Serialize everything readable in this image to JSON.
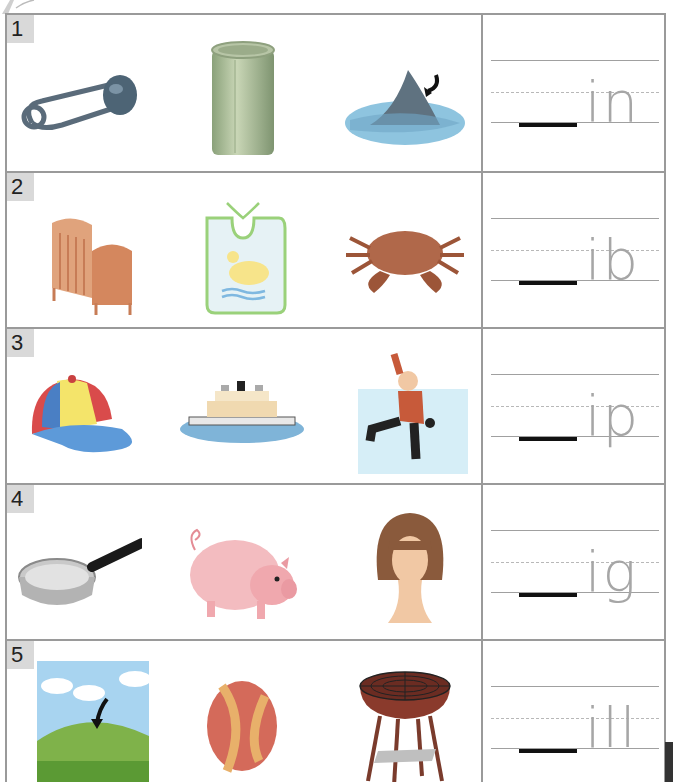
{
  "worksheet": {
    "rows": [
      {
        "number": "1",
        "pictures": [
          "safety-pin",
          "can",
          "shark-fin"
        ],
        "word_ending": "in"
      },
      {
        "number": "2",
        "pictures": [
          "crib",
          "bib",
          "crab"
        ],
        "word_ending": "ib"
      },
      {
        "number": "3",
        "pictures": [
          "cap",
          "ship",
          "boy-slipping"
        ],
        "word_ending": "ip"
      },
      {
        "number": "4",
        "pictures": [
          "pan",
          "pig",
          "wig"
        ],
        "word_ending": "ig"
      },
      {
        "number": "5",
        "pictures": [
          "hill",
          "ball",
          "grill"
        ],
        "word_ending": "ill"
      }
    ],
    "colors": {
      "border": "#9a9a9a",
      "badge_bg": "#d9d9d9",
      "guide_letters": "#a6a6a6",
      "answer_blank": "#111111"
    }
  }
}
